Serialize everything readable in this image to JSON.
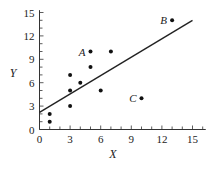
{
  "chart_data": {
    "type": "scatter",
    "title": "",
    "xlabel": "X",
    "ylabel": "Y",
    "xlim": [
      0,
      16
    ],
    "ylim": [
      0,
      15
    ],
    "xticks": [
      0,
      3,
      6,
      9,
      12,
      15
    ],
    "yticks": [
      0,
      3,
      6,
      9,
      12,
      15
    ],
    "grid": false,
    "legend": null,
    "points": [
      {
        "x": 1,
        "y": 1,
        "label": ""
      },
      {
        "x": 1,
        "y": 2,
        "label": ""
      },
      {
        "x": 3,
        "y": 3,
        "label": ""
      },
      {
        "x": 3,
        "y": 5,
        "label": ""
      },
      {
        "x": 3,
        "y": 7,
        "label": ""
      },
      {
        "x": 4,
        "y": 6,
        "label": ""
      },
      {
        "x": 5,
        "y": 8,
        "label": ""
      },
      {
        "x": 5,
        "y": 10,
        "label": "A"
      },
      {
        "x": 6,
        "y": 5,
        "label": ""
      },
      {
        "x": 7,
        "y": 10,
        "label": ""
      },
      {
        "x": 10,
        "y": 4,
        "label": "C"
      },
      {
        "x": 13,
        "y": 14,
        "label": "B"
      }
    ],
    "regression_line": {
      "x0": 0,
      "y0": 2.2,
      "x1": 15,
      "y1": 14
    }
  }
}
